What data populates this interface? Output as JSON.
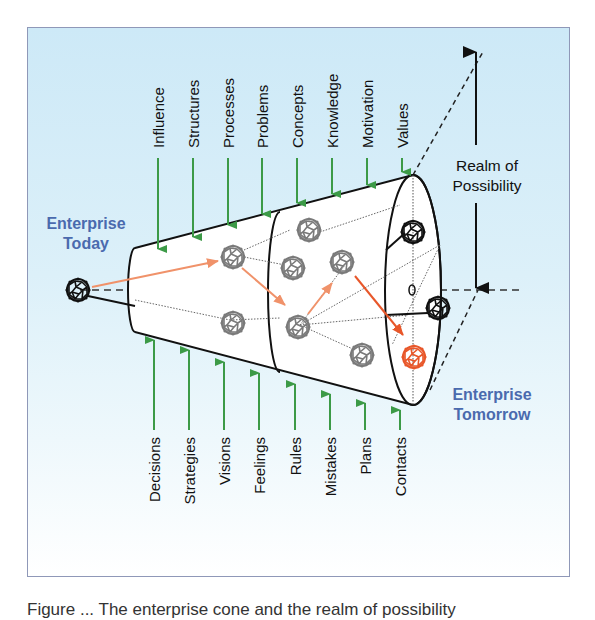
{
  "diagram": {
    "colors": {
      "panel_top": "#cde9f7",
      "panel_border": "#8f98b8",
      "force_arrow": "#3c9a47",
      "path_arrow": "#f0926a",
      "highlight_node": "#e8572a",
      "node_gray": "#7a7a7a",
      "node_black": "#111111",
      "enterprise_label": "#4a6aae"
    },
    "labels": {
      "enterprise_today": [
        "Enterprise",
        "Today"
      ],
      "enterprise_tomorrow": [
        "Enterprise",
        "Tomorrow"
      ],
      "realm": [
        "Realm of",
        "Possibility"
      ]
    },
    "top_forces": [
      "Influence",
      "Structures",
      "Processes",
      "Problems",
      "Concepts",
      "Knowledge",
      "Motivation",
      "Values"
    ],
    "bottom_forces": [
      "Decisions",
      "Strategies",
      "Visions",
      "Feelings",
      "Rules",
      "Mistakes",
      "Plans",
      "Contacts"
    ]
  },
  "caption": "Figure ... The enterprise cone and the realm of possibility"
}
